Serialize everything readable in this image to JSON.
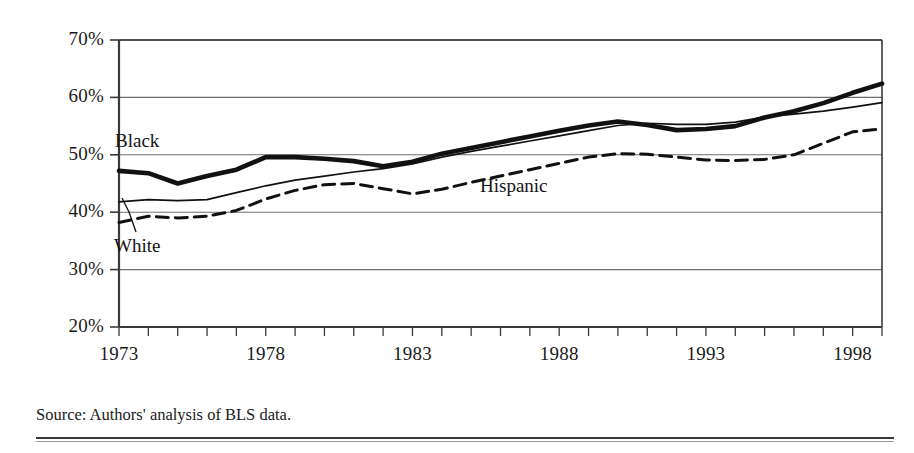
{
  "figure": {
    "source_note": "Source: Authors' analysis of BLS data."
  },
  "chart_data": {
    "type": "line",
    "title": "",
    "subtitle": "",
    "xlabel": "",
    "ylabel": "",
    "xlim": [
      1973,
      1999
    ],
    "ylim": [
      20,
      70
    ],
    "grid": true,
    "grid_axis": "y",
    "legend_position": "inline-annotations",
    "y_tick_labels": [
      "70%",
      "60%",
      "50%",
      "40%",
      "30%",
      "20%"
    ],
    "y_ticks": [
      70,
      60,
      50,
      40,
      30,
      20
    ],
    "x_tick_labels": [
      "1973",
      "1978",
      "1983",
      "1988",
      "1993",
      "1998"
    ],
    "x_ticks": [
      1973,
      1978,
      1983,
      1988,
      1993,
      1998
    ],
    "x_minor_tick_interval": 1,
    "x": [
      1973,
      1974,
      1975,
      1976,
      1977,
      1978,
      1979,
      1980,
      1981,
      1982,
      1983,
      1984,
      1985,
      1986,
      1987,
      1988,
      1989,
      1990,
      1991,
      1992,
      1993,
      1994,
      1995,
      1996,
      1997,
      1998,
      1999
    ],
    "series": [
      {
        "name": "Black",
        "style": "thick-solid",
        "color": "#111111",
        "label_text": "Black",
        "values": [
          47.2,
          46.8,
          45.0,
          46.3,
          47.4,
          49.6,
          49.6,
          49.3,
          48.9,
          48.0,
          48.8,
          50.2,
          51.2,
          52.2,
          53.2,
          54.2,
          55.1,
          55.8,
          55.2,
          54.3,
          54.5,
          55.0,
          56.5,
          57.6,
          59.0,
          60.8,
          62.4
        ]
      },
      {
        "name": "White",
        "style": "thin-solid",
        "color": "#111111",
        "label_text": "White",
        "values": [
          41.8,
          42.2,
          42.0,
          42.2,
          43.4,
          44.6,
          45.6,
          46.3,
          47.0,
          47.6,
          48.4,
          49.6,
          50.6,
          51.5,
          52.4,
          53.3,
          54.2,
          55.1,
          55.5,
          55.3,
          55.3,
          55.7,
          56.6,
          57.1,
          57.6,
          58.3,
          59.1
        ]
      },
      {
        "name": "Hispanic",
        "style": "dashed",
        "color": "#111111",
        "label_text": "Hispanic",
        "values": [
          38.2,
          39.3,
          39.0,
          39.3,
          40.3,
          42.3,
          43.8,
          44.8,
          45.0,
          44.1,
          43.2,
          44.0,
          45.2,
          46.3,
          47.4,
          48.5,
          49.6,
          50.2,
          50.1,
          49.6,
          49.1,
          49.0,
          49.2,
          50.0,
          52.0,
          54.0,
          54.5
        ]
      }
    ],
    "annotations": [
      {
        "text": "Black",
        "x_px": 115,
        "y_px": 130,
        "leader": false
      },
      {
        "text": "White",
        "x_px": 114,
        "y_px": 235,
        "leader": true
      },
      {
        "text": "Hispanic",
        "x_px": 480,
        "y_px": 175,
        "leader": false
      }
    ]
  }
}
